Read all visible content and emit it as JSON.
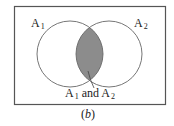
{
  "figure": {
    "caption": {
      "open": "(",
      "letter": "b",
      "close": ")"
    },
    "sets": [
      {
        "id": "A1",
        "base": "A",
        "subscript": "1"
      },
      {
        "id": "A2",
        "base": "A",
        "subscript": "2"
      }
    ],
    "intersection_label": {
      "first_base": "A",
      "first_sub": "1",
      "conjunction": " and ",
      "second_base": "A",
      "second_sub": "2"
    },
    "colors": {
      "frame": "#555555",
      "circle_stroke": "#666666",
      "intersection_fill": "#8c8c8c",
      "text": "#222222"
    }
  }
}
